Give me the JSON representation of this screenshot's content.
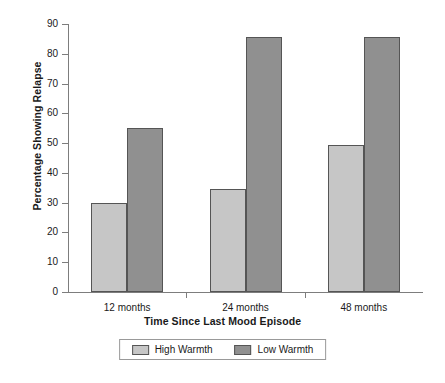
{
  "chart_data": {
    "type": "bar",
    "title": "",
    "xlabel": "Time Since Last Mood Episode",
    "ylabel": "Percentage Showing Relapse",
    "categories": [
      "12 months",
      "24 months",
      "48 months"
    ],
    "series": [
      {
        "name": "High Warmth",
        "color": "#c6c6c6",
        "values": [
          30,
          34.5,
          49.5
        ]
      },
      {
        "name": "Low Warmth",
        "color": "#909090",
        "values": [
          55,
          85.5,
          85.5
        ]
      }
    ],
    "ylim": [
      0,
      90
    ],
    "ytick_step": 10,
    "yticks": [
      0,
      10,
      20,
      30,
      40,
      50,
      60,
      70,
      80,
      90
    ],
    "ytick_labels": [
      "0",
      "10",
      "20",
      "30",
      "40",
      "50",
      "60",
      "70",
      "80",
      "90"
    ],
    "grid": false,
    "legend_position": "bottom",
    "legend_entries": [
      "High Warmth",
      "Low Warmth"
    ]
  }
}
